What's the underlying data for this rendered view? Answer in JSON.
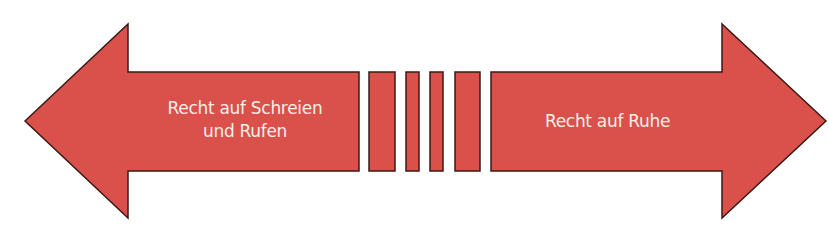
{
  "diagram": {
    "fill_color": "#d9514a",
    "stroke_color": "#3a1a18",
    "left_arrow": {
      "label_line1": "Recht auf Schreien",
      "label_line2": "und Rufen"
    },
    "right_arrow": {
      "label": "Recht auf Ruhe"
    },
    "separator_bars": 4
  }
}
